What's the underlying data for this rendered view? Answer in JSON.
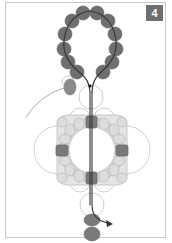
{
  "figure": {
    "step_number": "4",
    "colors": {
      "dark_bead": "#707070",
      "light_bead": "#d9d9d9",
      "outline": "#c4c4c4",
      "thread": "#333333",
      "frame": "#c8c8c8"
    }
  }
}
